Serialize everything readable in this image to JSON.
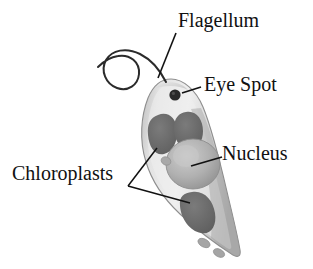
{
  "figure": {
    "background_color": "#ffffff",
    "organism": "Euglena",
    "cell": {
      "body_fill_light": "#e8e8e8",
      "body_fill_mid": "#cfcfcf",
      "body_fill_shadow": "#a9a9a9",
      "outline_color": "#8a8a8a",
      "tilt_degrees": 20
    },
    "colors": {
      "chloroplast": "#6f6f6f",
      "chloroplast_dark": "#5c5c5c",
      "nucleus_fill": "#b4b4b4",
      "nucleus_shade": "#8f8f8f",
      "eye_spot": "#2a2a2a",
      "granule": "#9a9a9a",
      "flagellum": "#2b2b2b",
      "leader_line": "#111111",
      "text": "#111111"
    }
  },
  "labels": {
    "flagellum": "Flagellum",
    "eye_spot": "Eye Spot",
    "nucleus": "Nucleus",
    "chloroplasts": "Chloroplasts"
  },
  "structures": [
    {
      "name": "flagellum",
      "label": "Flagellum",
      "count": 1,
      "description": "long whip-like appendage with a loop extending from the anterior end"
    },
    {
      "name": "eye-spot",
      "label": "Eye Spot",
      "count": 1,
      "description": "small dark pigment spot near the anterior tip"
    },
    {
      "name": "nucleus",
      "label": "Nucleus",
      "count": 1,
      "description": "large round organelle in the middle of the cell"
    },
    {
      "name": "chloroplasts",
      "label": "Chloroplasts",
      "count": 3,
      "description": "dark lobed plastids distributed through the cytoplasm"
    }
  ],
  "leader_lines": [
    {
      "from": "Flagellum",
      "to": "flagellum-base",
      "style": "straight-diagonal"
    },
    {
      "from": "Eye Spot",
      "to": "eye-spot",
      "style": "straight-horizontal"
    },
    {
      "from": "Nucleus",
      "to": "nucleus",
      "style": "straight-horizontal"
    },
    {
      "from": "Chloroplasts",
      "to": "chloroplast-upper",
      "style": "forked-diagonal"
    },
    {
      "from": "Chloroplasts",
      "to": "chloroplast-lower",
      "style": "forked-diagonal"
    }
  ]
}
